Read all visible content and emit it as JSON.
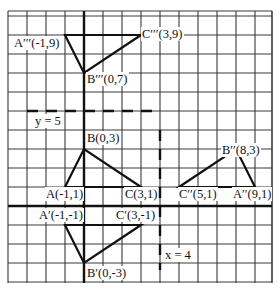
{
  "diagram": {
    "type": "coordinate-grid-transformations",
    "grid": {
      "x_min": -4,
      "x_max": 10,
      "y_min": -4,
      "y_max": 10
    },
    "axes_color": "#111111",
    "grid_color": "#333333",
    "mirror_lines": [
      {
        "id": "y5",
        "label": "y = 5",
        "orientation": "horizontal",
        "value": 5
      },
      {
        "id": "x4",
        "label": "x = 4",
        "orientation": "vertical",
        "value": 4
      }
    ],
    "triangles": [
      {
        "id": "ABC",
        "points": [
          {
            "name": "A",
            "label": "A(-1,1)",
            "x": -1,
            "y": 1
          },
          {
            "name": "B",
            "label": "B(0,3)",
            "x": 0,
            "y": 3
          },
          {
            "name": "C",
            "label": "C(3,1)",
            "x": 3,
            "y": 1
          }
        ]
      },
      {
        "id": "A1B1C1",
        "points": [
          {
            "name": "A'",
            "label": "A′(-1,-1)",
            "x": -1,
            "y": -1
          },
          {
            "name": "B'",
            "label": "B′(0,-3)",
            "x": 0,
            "y": -3
          },
          {
            "name": "C'",
            "label": "C′(3,-1)",
            "x": 3,
            "y": -1
          }
        ]
      },
      {
        "id": "A2B2C2",
        "points": [
          {
            "name": "A''",
            "label": "A′′(9,1)",
            "x": 9,
            "y": 1
          },
          {
            "name": "B''",
            "label": "B′′(8,3)",
            "x": 8,
            "y": 3
          },
          {
            "name": "C''",
            "label": "C′′(5,1)",
            "x": 5,
            "y": 1
          }
        ]
      },
      {
        "id": "A3B3C3",
        "points": [
          {
            "name": "A'''",
            "label": "A′′′(-1,9)",
            "x": -1,
            "y": 9
          },
          {
            "name": "B'''",
            "label": "B′′′(0,7)",
            "x": 0,
            "y": 7
          },
          {
            "name": "C'''",
            "label": "C′′′(3,9)",
            "x": 3,
            "y": 9
          }
        ]
      }
    ]
  },
  "labels": {
    "A3": "A′′′(-1,9)",
    "B3": "B′′′(0,7)",
    "C3": "C′′′(3,9)",
    "y5": "y = 5",
    "B": "B(0,3)",
    "A": "A(-1,1)",
    "C": "C(3,1)",
    "B2": "B′′(8,3)",
    "C2": "C′′(5,1)",
    "A2": "A′′(9,1)",
    "A1": "A′(-1,-1)",
    "C1": "C′(3,-1)",
    "B1": "B′(0,-3)",
    "x4": "x = 4"
  }
}
